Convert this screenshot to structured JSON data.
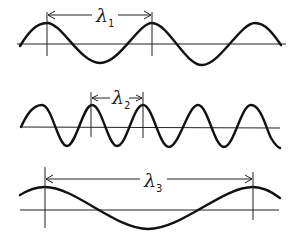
{
  "diagram": {
    "title": "",
    "waves": [
      {
        "id": "wave-1",
        "symbol": "λ",
        "subscript": "1",
        "crests_visible": 3,
        "relative_wavelength": "medium"
      },
      {
        "id": "wave-2",
        "symbol": "λ",
        "subscript": "2",
        "crests_visible": 5,
        "relative_wavelength": "short"
      },
      {
        "id": "wave-3",
        "symbol": "λ",
        "subscript": "3",
        "crests_visible": 2,
        "relative_wavelength": "long"
      }
    ],
    "colors": {
      "line": "#111111",
      "background": "#ffffff"
    }
  }
}
